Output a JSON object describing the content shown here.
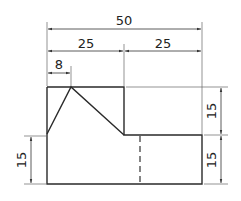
{
  "drawing": {
    "type": "technical-drawing",
    "units": "mm",
    "dimensions": {
      "overall_width": "50",
      "left_width": "25",
      "right_width": "25",
      "peak_offset": "8",
      "right_upper_height": "15",
      "right_lower_height": "15",
      "left_lower_height": "15"
    },
    "colors": {
      "line": "#2a2a2a",
      "thin": "#555555"
    }
  }
}
